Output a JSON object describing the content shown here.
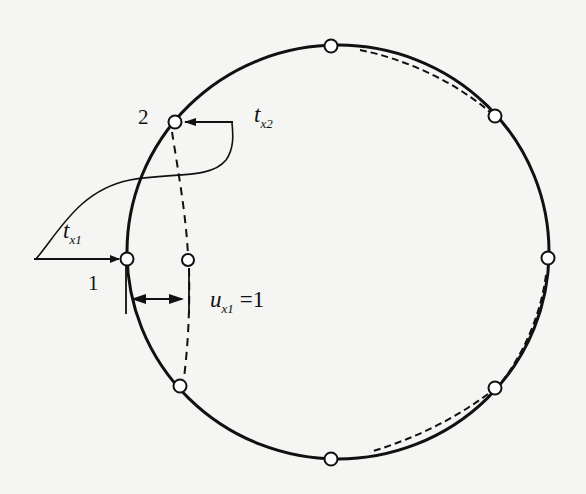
{
  "figure": {
    "node_labels": {
      "node_1": "1",
      "node_2": "2"
    },
    "traction_1": {
      "symbol": "t",
      "subscript": "x1"
    },
    "traction_2": {
      "symbol": "t",
      "subscript": "x2"
    },
    "displacement": {
      "symbol": "u",
      "subscript": "x1",
      "equals": "=1"
    },
    "colors": {
      "stroke": "#111111",
      "background": "#f5f5f3",
      "node_fill": "#ffffff"
    },
    "circle": {
      "cx": 338,
      "cy": 252,
      "rx": 211,
      "ry": 207
    },
    "nodes": [
      {
        "id": "top",
        "x": 331,
        "y": 46
      },
      {
        "id": "upper-right",
        "x": 495,
        "y": 116
      },
      {
        "id": "right",
        "x": 548,
        "y": 258
      },
      {
        "id": "lower-right",
        "x": 495,
        "y": 388
      },
      {
        "id": "bottom",
        "x": 331,
        "y": 459
      },
      {
        "id": "lower-left",
        "x": 180,
        "y": 386
      },
      {
        "id": "node-1",
        "x": 127,
        "y": 259
      },
      {
        "id": "node-2",
        "x": 175,
        "y": 122
      }
    ],
    "displaced_node": {
      "x": 188,
      "y": 260
    }
  }
}
